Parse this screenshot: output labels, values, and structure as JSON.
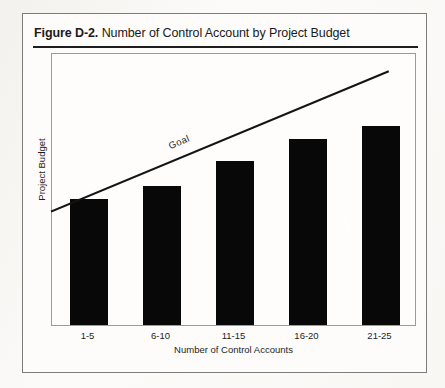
{
  "figure": {
    "label": "Figure D-2.",
    "title": "Number of Control Account by Project Budget"
  },
  "chart_data": {
    "type": "bar",
    "title": "Number of Control Account by Project Budget",
    "xlabel": "Number of Control Accounts",
    "ylabel": "Project Budget",
    "categories": [
      "1-5",
      "6-10",
      "11-15",
      "16-20",
      "21-25"
    ],
    "values": [
      0.46,
      0.51,
      0.6,
      0.68,
      0.73
    ],
    "ylim": [
      0,
      1
    ],
    "grid": false,
    "legend": null,
    "series": [
      {
        "name": "Project Budget",
        "values": [
          0.46,
          0.51,
          0.6,
          0.68,
          0.73
        ],
        "color": "#080808"
      }
    ],
    "annotations": [
      {
        "name": "goal-line",
        "label": "Goal",
        "type": "line",
        "x_start": 0.0,
        "y_start": 0.42,
        "x_end": 0.925,
        "y_end": 0.935,
        "color": "#141414"
      }
    ]
  },
  "axis": {
    "x_ticks": [
      "1-5",
      "6-10",
      "11-15",
      "16-20",
      "21-25"
    ],
    "x_title": "Number of Control Accounts",
    "y_title": "Project Budget"
  },
  "colors": {
    "bar": "#080808",
    "goal_line": "#141414",
    "frame": "#9b9b9b",
    "card_border": "#7c7c7c",
    "rule": "#1e1e1e",
    "text": "#1d1d1d",
    "page_background": "#fcfbf9"
  }
}
